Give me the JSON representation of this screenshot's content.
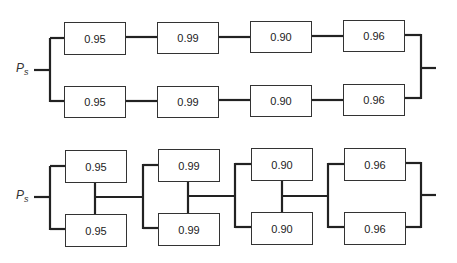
{
  "diagrams": [
    {
      "name": "series-parallel (two parallel series chains)",
      "input_label": "P",
      "input_subscript": "s",
      "rows": [
        [
          "0.95",
          "0.99",
          "0.90",
          "0.96"
        ],
        [
          "0.95",
          "0.99",
          "0.90",
          "0.96"
        ]
      ]
    },
    {
      "name": "parallel-series (series of parallel pairs)",
      "input_label": "P",
      "input_subscript": "s",
      "rows": [
        [
          "0.95",
          "0.99",
          "0.90",
          "0.96"
        ],
        [
          "0.95",
          "0.99",
          "0.90",
          "0.96"
        ]
      ]
    }
  ]
}
